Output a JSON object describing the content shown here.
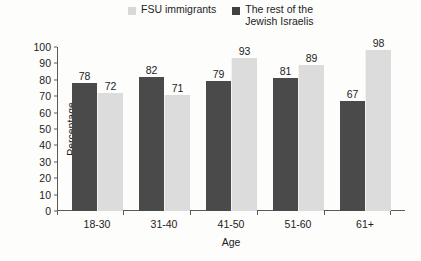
{
  "chart_data": {
    "type": "bar",
    "title": "",
    "subtitle": "",
    "xlabel": "Age",
    "ylabel": "Percentage",
    "categories": [
      "18-30",
      "31-40",
      "41-50",
      "51-60",
      "61+"
    ],
    "series": [
      {
        "name": "The rest of the\nJewish Israelis",
        "legend_label": "The rest of the\nJewish Israelis",
        "color": "#4a4a4a",
        "values": [
          78,
          82,
          79,
          81,
          67
        ]
      },
      {
        "name": "FSU immigrants",
        "legend_label": "FSU immigrants",
        "color": "#dcdcdc",
        "values": [
          72,
          71,
          93,
          89,
          98
        ]
      }
    ],
    "ylim": [
      0,
      100
    ],
    "ytick_step": 10,
    "yticks": [
      0,
      10,
      20,
      30,
      40,
      50,
      60,
      70,
      80,
      90,
      100
    ],
    "grid": false,
    "legend_position": "top",
    "data_labels": true,
    "bar_order": [
      "The rest of the Jewish Israelis",
      "FSU immigrants"
    ]
  },
  "legend": {
    "items": [
      {
        "label": "FSU immigrants",
        "swatch": "light-gray-swatch-icon",
        "color": "#d8d8d8"
      },
      {
        "label": "The rest of the\nJewish Israelis",
        "swatch": "dark-gray-swatch-icon",
        "color": "#404040"
      }
    ]
  },
  "axes": {
    "y_label": "Percentage",
    "x_label": "Age",
    "y_ticks": [
      "100",
      "90",
      "80",
      "70",
      "60",
      "50",
      "40",
      "30",
      "20",
      "10",
      "0"
    ],
    "x_ticks": [
      "18-30",
      "31-40",
      "41-50",
      "51-60",
      "61+"
    ]
  }
}
